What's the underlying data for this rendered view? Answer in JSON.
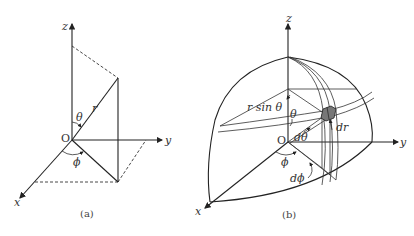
{
  "figure": {
    "panel_a": {
      "caption": "(a)",
      "axes": {
        "x": "x",
        "y": "y",
        "z": "z"
      },
      "origin": "O",
      "radius_label": "r",
      "polar_angle_label": "θ",
      "azimuth_label": "ϕ"
    },
    "panel_b": {
      "caption": "(b)",
      "axes": {
        "x": "x",
        "y": "y",
        "z": "z"
      },
      "origin": "O",
      "r_sin_theta_label": "r sin θ",
      "theta_label": "θ",
      "d_theta_label": "dθ",
      "dr_label": "dr",
      "phi_label": "ϕ",
      "d_phi_label": "dϕ"
    }
  }
}
